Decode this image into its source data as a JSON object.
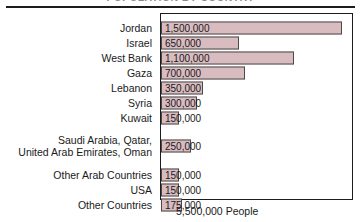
{
  "figure": {
    "title": "POPULATION BY COUNTRY",
    "footer_caption": "5,500,000 People",
    "bar_color": "#d9bcc0",
    "bar_border_color": "#4a4a4a",
    "frame_color": "#1c1c1c"
  },
  "chart_data": {
    "type": "bar",
    "orientation": "horizontal",
    "title": "POPULATION BY COUNTRY",
    "xlabel": "",
    "ylabel": "",
    "total_label": "5,500,000 People",
    "total": 5500000,
    "xlim": [
      0,
      1750000
    ],
    "grid": false,
    "legend": null,
    "categories": [
      "Jordan",
      "Israel",
      "West Bank",
      "Gaza",
      "Lebanon",
      "Syria",
      "Kuwait",
      "Saudi Arabia, Qatar,\nUnited Arab Emirates, Oman",
      "Other Arab Countries",
      "USA",
      "Other Countries"
    ],
    "values": [
      1500000,
      650000,
      1100000,
      700000,
      350000,
      300000,
      150000,
      250000,
      150000,
      150000,
      175000
    ],
    "value_labels": [
      "1,500,000",
      "650,000",
      "1,100,000",
      "700,000",
      "350,000",
      "300,000",
      "150,000",
      "250,000",
      "150,000",
      "150,000",
      "175,000"
    ]
  },
  "rows": [
    {
      "label": "Jordan",
      "value_label": "1,500,000",
      "value": 1500000
    },
    {
      "label": "Israel",
      "value_label": "650,000",
      "value": 650000
    },
    {
      "label": "West Bank",
      "value_label": "1,100,000",
      "value": 1100000
    },
    {
      "label": "Gaza",
      "value_label": "700,000",
      "value": 700000
    },
    {
      "label": "Lebanon",
      "value_label": "350,000",
      "value": 350000
    },
    {
      "label": "Syria",
      "value_label": "300,000",
      "value": 300000
    },
    {
      "label": "Kuwait",
      "value_label": "150,000",
      "value": 150000
    },
    {
      "label": "Saudi Arabia, Qatar,\nUnited Arab Emirates, Oman",
      "value_label": "250,000",
      "value": 250000
    },
    {
      "label": "Other Arab Countries",
      "value_label": "150,000",
      "value": 150000
    },
    {
      "label": "USA",
      "value_label": "150,000",
      "value": 150000
    },
    {
      "label": "Other Countries",
      "value_label": "175,000",
      "value": 175000
    }
  ]
}
